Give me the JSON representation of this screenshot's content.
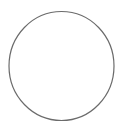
{
  "canvas": {
    "width": 134,
    "height": 126,
    "background": "#ffffff"
  },
  "shape": {
    "type": "circle-outline",
    "cx": 61.5,
    "cy": 66,
    "rx": 52.5,
    "ry": 54.5,
    "stroke": "#6b6b6b",
    "stroke_width": 1.2,
    "fill": "none"
  }
}
